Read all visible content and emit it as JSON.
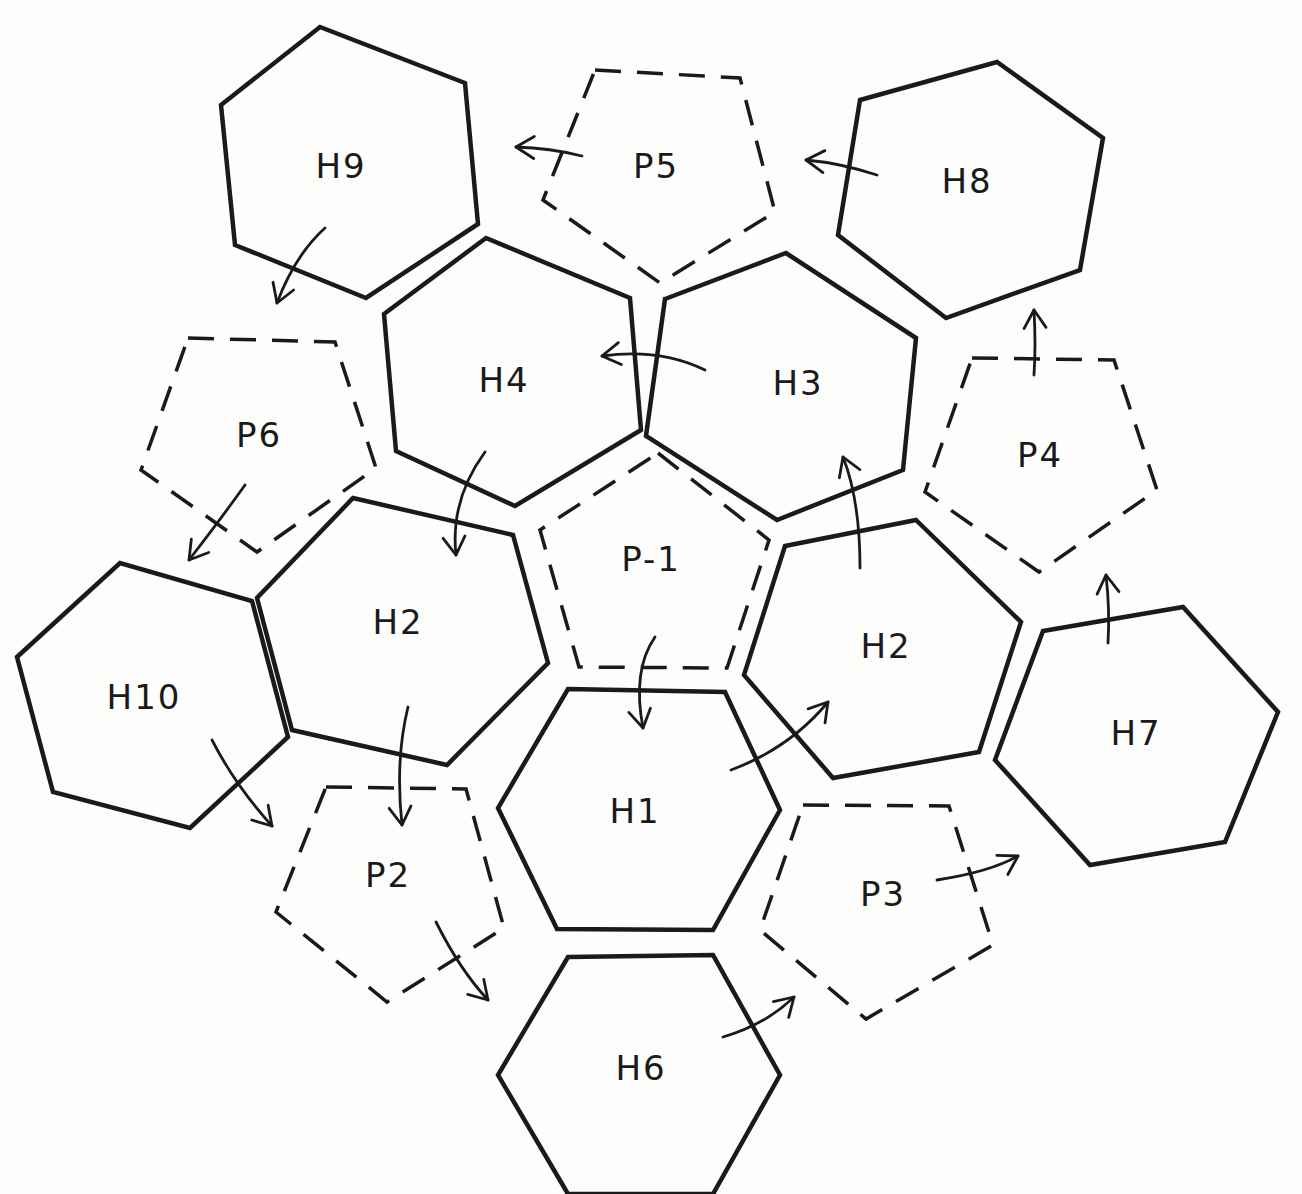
{
  "diagram": {
    "title": "",
    "ink_color": "#1a1a1a",
    "paper_color": "#fdfdfc",
    "shapes": [
      {
        "id": "H9",
        "label": "H9",
        "kind": "hexagon",
        "style": "solid"
      },
      {
        "id": "P5",
        "label": "P5",
        "kind": "pentagon",
        "style": "dashed"
      },
      {
        "id": "H8",
        "label": "H8",
        "kind": "hexagon",
        "style": "solid"
      },
      {
        "id": "H4",
        "label": "H4",
        "kind": "hexagon",
        "style": "solid"
      },
      {
        "id": "H3",
        "label": "H3",
        "kind": "hexagon",
        "style": "solid"
      },
      {
        "id": "P6",
        "label": "P6",
        "kind": "pentagon",
        "style": "dashed"
      },
      {
        "id": "P4",
        "label": "P4",
        "kind": "pentagon",
        "style": "dashed"
      },
      {
        "id": "P-1",
        "label": "P-1",
        "kind": "pentagon",
        "style": "dashed"
      },
      {
        "id": "H2a",
        "label": "H2",
        "kind": "hexagon",
        "style": "solid"
      },
      {
        "id": "H2b",
        "label": "H2",
        "kind": "hexagon",
        "style": "solid"
      },
      {
        "id": "H10",
        "label": "H10",
        "kind": "hexagon",
        "style": "solid"
      },
      {
        "id": "H7",
        "label": "H7",
        "kind": "hexagon",
        "style": "solid"
      },
      {
        "id": "H1",
        "label": "H1",
        "kind": "hexagon",
        "style": "solid"
      },
      {
        "id": "P2",
        "label": "P2",
        "kind": "pentagon",
        "style": "dashed"
      },
      {
        "id": "P3",
        "label": "P3",
        "kind": "pentagon",
        "style": "dashed"
      },
      {
        "id": "H6",
        "label": "H6",
        "kind": "hexagon",
        "style": "solid"
      }
    ],
    "sequence_arrows": [
      {
        "from": "P-1",
        "to": "H1"
      },
      {
        "from": "H1",
        "to": "H2b"
      },
      {
        "from": "H2b",
        "to": "H3"
      },
      {
        "from": "H3",
        "to": "H4"
      },
      {
        "from": "H4",
        "to": "H2a"
      },
      {
        "from": "H2a",
        "to": "P2"
      },
      {
        "from": "P2",
        "to": "H6"
      },
      {
        "from": "H6",
        "to": "P3"
      },
      {
        "from": "P3",
        "to": "H7"
      },
      {
        "from": "H7",
        "to": "P4"
      },
      {
        "from": "P4",
        "to": "H8"
      },
      {
        "from": "H8",
        "to": "P5"
      },
      {
        "from": "P5",
        "to": "H9"
      },
      {
        "from": "H9",
        "to": "P6"
      },
      {
        "from": "P6",
        "to": "H10"
      },
      {
        "from": "H10",
        "to": "P2"
      }
    ]
  }
}
